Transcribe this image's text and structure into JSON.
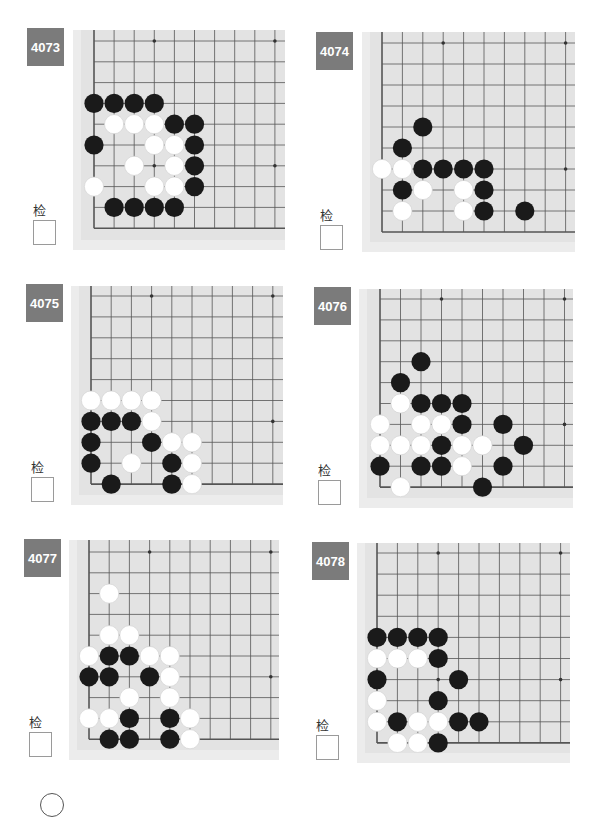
{
  "check_label": "检查",
  "colors": {
    "label_bg": "#7b7b7b",
    "board_bg": "#e3e3e3",
    "board_margin": "#ececec",
    "grid_line": "#555555",
    "black_stone": "#1a1a1a",
    "white_stone": "#ffffff"
  },
  "problems": [
    {
      "id": "4073",
      "label_pos": [
        27,
        28
      ],
      "check_pos": [
        33,
        200
      ],
      "board": {
        "x": 73,
        "y": 30,
        "w": 212,
        "h": 220,
        "grid_x0": 94,
        "grid_y0": 41,
        "step_x": 20.1,
        "step_y": 20.8
      },
      "black": [
        [
          0,
          3
        ],
        [
          1,
          3
        ],
        [
          2,
          3
        ],
        [
          3,
          3
        ],
        [
          4,
          4
        ],
        [
          5,
          4
        ],
        [
          0,
          5
        ],
        [
          5,
          5
        ],
        [
          5,
          6
        ],
        [
          5,
          7
        ],
        [
          1,
          8
        ],
        [
          2,
          8
        ],
        [
          3,
          8
        ],
        [
          4,
          8
        ]
      ],
      "white": [
        [
          1,
          4
        ],
        [
          2,
          4
        ],
        [
          3,
          4
        ],
        [
          3,
          5
        ],
        [
          4,
          5
        ],
        [
          2,
          6
        ],
        [
          4,
          6
        ],
        [
          0,
          7
        ],
        [
          3,
          7
        ],
        [
          4,
          7
        ]
      ]
    },
    {
      "id": "4074",
      "label_pos": [
        316,
        32
      ],
      "check_pos": [
        320,
        205
      ],
      "board": {
        "x": 362,
        "y": 32,
        "w": 213,
        "h": 220,
        "grid_x0": 382,
        "grid_y0": 43,
        "step_x": 20.4,
        "step_y": 21.0
      },
      "black": [
        [
          2,
          4
        ],
        [
          1,
          5
        ],
        [
          2,
          6
        ],
        [
          3,
          6
        ],
        [
          4,
          6
        ],
        [
          5,
          6
        ],
        [
          1,
          7
        ],
        [
          5,
          7
        ],
        [
          5,
          8
        ],
        [
          7,
          8
        ]
      ],
      "white": [
        [
          0,
          6
        ],
        [
          1,
          6
        ],
        [
          2,
          7
        ],
        [
          4,
          7
        ],
        [
          1,
          8
        ],
        [
          4,
          8
        ]
      ]
    },
    {
      "id": "4075",
      "label_pos": [
        26,
        284
      ],
      "check_pos": [
        31,
        457
      ],
      "board": {
        "x": 71,
        "y": 286,
        "w": 212,
        "h": 219,
        "grid_x0": 91,
        "grid_y0": 296,
        "step_x": 20.2,
        "step_y": 20.9
      },
      "black": [
        [
          0,
          6
        ],
        [
          1,
          6
        ],
        [
          2,
          6
        ],
        [
          0,
          7
        ],
        [
          3,
          7
        ],
        [
          0,
          8
        ],
        [
          4,
          8
        ],
        [
          1,
          9
        ],
        [
          4,
          9
        ]
      ],
      "white": [
        [
          0,
          5
        ],
        [
          1,
          5
        ],
        [
          2,
          5
        ],
        [
          3,
          5
        ],
        [
          3,
          6
        ],
        [
          4,
          7
        ],
        [
          5,
          7
        ],
        [
          2,
          8
        ],
        [
          5,
          8
        ],
        [
          5,
          9
        ]
      ]
    },
    {
      "id": "4076",
      "label_pos": [
        314,
        287
      ],
      "check_pos": [
        318,
        460
      ],
      "board": {
        "x": 359,
        "y": 289,
        "w": 214,
        "h": 219,
        "grid_x0": 380,
        "grid_y0": 299,
        "step_x": 20.5,
        "step_y": 20.9
      },
      "black": [
        [
          2,
          3
        ],
        [
          1,
          4
        ],
        [
          2,
          5
        ],
        [
          3,
          5
        ],
        [
          4,
          5
        ],
        [
          4,
          6
        ],
        [
          6,
          6
        ],
        [
          3,
          7
        ],
        [
          7,
          7
        ],
        [
          0,
          8
        ],
        [
          2,
          8
        ],
        [
          3,
          8
        ],
        [
          6,
          8
        ],
        [
          5,
          9
        ]
      ],
      "white": [
        [
          1,
          5
        ],
        [
          0,
          6
        ],
        [
          2,
          6
        ],
        [
          3,
          6
        ],
        [
          0,
          7
        ],
        [
          1,
          7
        ],
        [
          2,
          7
        ],
        [
          4,
          7
        ],
        [
          5,
          7
        ],
        [
          4,
          8
        ],
        [
          1,
          9
        ]
      ]
    },
    {
      "id": "4077",
      "label_pos": [
        24,
        539
      ],
      "check_pos": [
        29,
        712
      ],
      "board": {
        "x": 69,
        "y": 540,
        "w": 210,
        "h": 220,
        "grid_x0": 89,
        "grid_y0": 552,
        "step_x": 20.2,
        "step_y": 20.8
      },
      "black": [
        [
          1,
          5
        ],
        [
          2,
          5
        ],
        [
          0,
          6
        ],
        [
          1,
          6
        ],
        [
          3,
          6
        ],
        [
          2,
          8
        ],
        [
          4,
          8
        ],
        [
          1,
          9
        ],
        [
          2,
          9
        ],
        [
          4,
          9
        ]
      ],
      "white": [
        [
          1,
          2
        ],
        [
          1,
          4
        ],
        [
          2,
          4
        ],
        [
          0,
          5
        ],
        [
          3,
          5
        ],
        [
          4,
          5
        ],
        [
          4,
          6
        ],
        [
          2,
          7
        ],
        [
          4,
          7
        ],
        [
          0,
          8
        ],
        [
          1,
          8
        ],
        [
          5,
          8
        ],
        [
          5,
          9
        ]
      ]
    },
    {
      "id": "4078",
      "label_pos": [
        312,
        542
      ],
      "check_pos": [
        316,
        715
      ],
      "board": {
        "x": 357,
        "y": 543,
        "w": 213,
        "h": 220,
        "grid_x0": 377,
        "grid_y0": 553,
        "step_x": 20.4,
        "step_y": 21.1
      },
      "black": [
        [
          0,
          4
        ],
        [
          1,
          4
        ],
        [
          2,
          4
        ],
        [
          3,
          4
        ],
        [
          3,
          5
        ],
        [
          0,
          6
        ],
        [
          4,
          6
        ],
        [
          3,
          7
        ],
        [
          1,
          8
        ],
        [
          4,
          8
        ],
        [
          5,
          8
        ],
        [
          3,
          9
        ]
      ],
      "white": [
        [
          0,
          5
        ],
        [
          1,
          5
        ],
        [
          2,
          5
        ],
        [
          0,
          7
        ],
        [
          0,
          8
        ],
        [
          2,
          8
        ],
        [
          3,
          8
        ],
        [
          1,
          9
        ],
        [
          2,
          9
        ]
      ]
    }
  ]
}
